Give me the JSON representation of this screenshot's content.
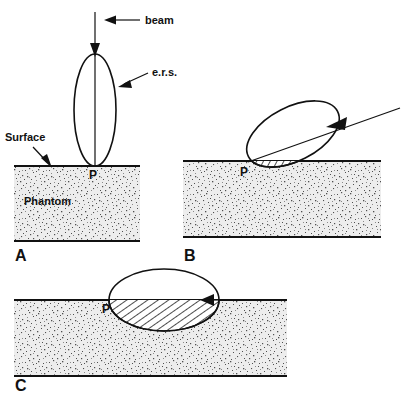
{
  "figure": {
    "colors": {
      "ink": "#111111",
      "phantom_fill": "#e9e9e9",
      "speckle": "#4a4a4a",
      "background": "#ffffff"
    },
    "labels": {
      "beam": "beam",
      "ers": "e.r.s.",
      "surface": "Surface",
      "phantom": "Phantom",
      "point_p": "P"
    },
    "panels": [
      {
        "id": "A",
        "letter": "A",
        "caption_letter": "A",
        "beam_orientation": "vertical",
        "beam_label": "beam",
        "ers_label": "e.r.s.",
        "surface_label": "Surface",
        "phantom_label": "Phantom",
        "point_label": "P",
        "ellipse": {
          "cx": 95,
          "cy": 110,
          "rx": 21,
          "ry": 56,
          "rotation_deg": 0,
          "hatched_fraction": 0.0
        },
        "phantom_rect": {
          "x": 14,
          "y": 166,
          "width": 126,
          "height": 75
        },
        "contact_point": {
          "x": 95,
          "y": 166
        }
      },
      {
        "id": "B",
        "letter": "B",
        "caption_letter": "B",
        "beam_orientation": "oblique",
        "point_label": "P",
        "ellipse": {
          "cx": 293,
          "cy": 134,
          "rx": 50,
          "ry": 27,
          "rotation_deg": -27,
          "hatched_fraction": 0.25
        },
        "phantom_rect": {
          "x": 183,
          "y": 161,
          "width": 198,
          "height": 76
        },
        "contact_point": {
          "x": 247,
          "y": 161
        }
      },
      {
        "id": "C",
        "letter": "C",
        "caption_letter": "C",
        "beam_orientation": "horizontal",
        "point_label": "P",
        "ellipse": {
          "cx": 164,
          "cy": 300,
          "rx": 55,
          "ry": 31,
          "rotation_deg": 0,
          "hatched_fraction": 0.5
        },
        "phantom_rect": {
          "x": 14,
          "y": 300,
          "width": 273,
          "height": 76
        },
        "contact_point": {
          "x": 110,
          "y": 300
        }
      }
    ]
  }
}
